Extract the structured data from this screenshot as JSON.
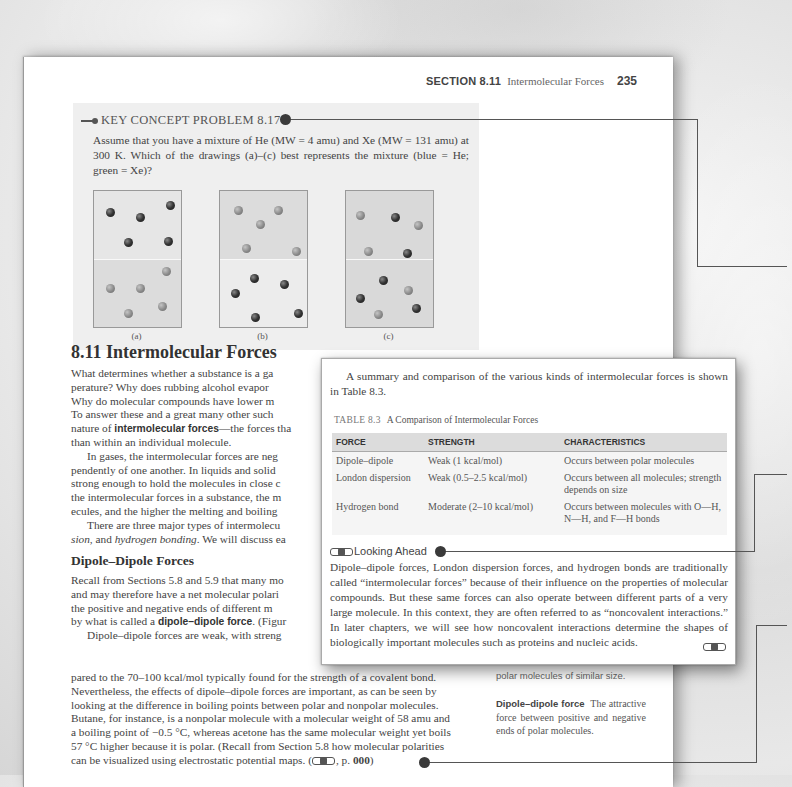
{
  "running_head": {
    "section_label": "SECTION 8.11",
    "section_title": "Intermolecular Forces",
    "page_number": "235"
  },
  "key_concept_problem": {
    "title": "KEY CONCEPT PROBLEM 8.17",
    "text": "Assume that you have a mixture of He (MW = 4 amu) and Xe (MW = 131 amu) at 300 K. Which of the drawings (a)–(c) best represents the mixture (blue = He; green = Xe)?",
    "drawings": [
      {
        "label": "(a)"
      },
      {
        "label": "(b)"
      },
      {
        "label": "(c)"
      }
    ]
  },
  "section": {
    "title": "8.11 Intermolecular Forces",
    "para1_lines": [
      "What determines whether a substance is a ga",
      "perature? Why does rubbing alcohol evapor",
      "Why do molecular compounds have lower m",
      "To answer these and a great many other such"
    ],
    "para1_pre": "nature of ",
    "para1_bold": "intermolecular forces",
    "para1_post": "—the forces tha",
    "para1_last": "than within an individual molecule.",
    "para2_lines": [
      "In gases, the intermolecular forces are neg",
      "pendently of one another. In liquids and solid",
      "strong enough to hold the molecules in close c",
      "the intermolecular forces in a substance, the m",
      "ecules, and the higher the melting and boiling"
    ],
    "para3_line1": "There are three major types of intermolecu",
    "para3_italic1": "sion",
    "para3_mid": ", and ",
    "para3_italic2": "hydrogen bonding",
    "para3_end": ". We will discuss ea",
    "subsection_title": "Dipole–Dipole Forces",
    "dd_lines": [
      "Recall from Sections 5.8 and 5.9 that many mo",
      "and may therefore have a net molecular polari",
      "the positive and negative ends of different m"
    ],
    "dd_pre": "by what is called a ",
    "dd_bold": "dipole–dipole force",
    "dd_post": ". (Figur",
    "dd2_line1": "Dipole–dipole forces are weak, with streng",
    "dd2_lines": [
      "pared to the 70–100 kcal/mol typically found for the strength of a covalent bond.",
      "Nevertheless, the effects of dipole–dipole forces are important, as can be seen by",
      "looking at the difference in boiling points between polar and nonpolar molecules.",
      "Butane, for instance, is a nonpolar molecule with a molecular weight of 58 amu and",
      "a boiling point of −0.5 °C, whereas acetone has the same molecular weight yet boils",
      "57 °C higher because it is polar. (Recall from Section 5.8 how molecular polarities"
    ],
    "dd2_last_pre": "can be visualized using electrostatic potential maps. (",
    "dd2_last_mid": ", p. ",
    "dd2_last_page": "000",
    "dd2_last_post": ")"
  },
  "margin": {
    "snippet": "polar molecules of similar size.",
    "term": "Dipole–dipole force",
    "definition": "The attractive force between positive and negative ends of polar molecules."
  },
  "card": {
    "intro": "A summary and comparison of the various kinds of intermolecular forces is shown in Table 8.3.",
    "table_number": "TABLE 8.3",
    "table_title": "A Comparison of Intermolecular Forces",
    "columns": [
      "FORCE",
      "STRENGTH",
      "CHARACTERISTICS"
    ],
    "rows": [
      {
        "force": "Dipole–dipole",
        "strength": "Weak (1 kcal/mol)",
        "characteristics": "Occurs between polar molecules"
      },
      {
        "force": "London dispersion",
        "strength": "Weak (0.5–2.5 kcal/mol)",
        "characteristics": "Occurs between all molecules; strength depends on size"
      },
      {
        "force": "Hydrogen bond",
        "strength": "Moderate (2–10 kcal/mol)",
        "characteristics": "Occurs between molecules with O—H, N—H, and F—H bonds"
      }
    ],
    "looking_ahead_title": "Looking Ahead",
    "looking_ahead_text": "Dipole–dipole forces, London dispersion forces, and hydrogen bonds are traditionally called “intermolecular forces” because of their influence on the properties of molecular compounds. But these same forces can also operate between different parts of a very large molecule. In this context, they are often referred to as “noncovalent interactions.” In later chapters, we will see how noncovalent interactions determine the shapes of biologically important molecules such as proteins and nucleic acids."
  },
  "colors": {
    "page": "#ffffff",
    "kcp_box": "#efefef",
    "table_header": "#dcdcdc",
    "connector": "#555555",
    "text": "#444444"
  }
}
